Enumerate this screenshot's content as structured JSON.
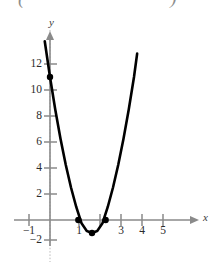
{
  "header": {
    "cropped_formula_fragment": "(              =              )"
  },
  "figure": {
    "x_axis_label": "x",
    "y_axis_label": "y"
  },
  "chart_data": {
    "type": "line",
    "title": "",
    "subtitle": "",
    "xlabel": "x",
    "ylabel": "y",
    "xlim": [
      -1.6,
      5.8
    ],
    "ylim": [
      -2.8,
      13.6
    ],
    "grid": false,
    "legend": null,
    "x_ticks": [
      -1,
      1,
      2,
      3,
      4,
      5
    ],
    "x_tick_labels": [
      "−1",
      "1",
      "",
      "3",
      "4",
      "5"
    ],
    "y_ticks": [
      -2,
      2,
      4,
      6,
      8,
      10,
      12
    ],
    "y_tick_labels": [
      "−2",
      "2",
      "4",
      "6",
      "8",
      "10",
      "12"
    ],
    "curve_name": "parabola",
    "curve_domain": [
      -0.25,
      4.15
    ],
    "series": [
      {
        "name": "parabola",
        "x": [
          -0.25,
          0.0,
          0.25,
          0.5,
          0.75,
          1.0,
          1.25,
          1.5,
          1.75,
          2.0,
          2.25,
          2.5,
          2.75,
          3.0,
          3.25,
          3.5,
          3.75,
          4.0,
          4.15
        ],
        "y": [
          13.75,
          11.0,
          8.5,
          6.25,
          4.25,
          2.5,
          1.0,
          -0.25,
          -0.85,
          -1.0,
          -0.85,
          -0.25,
          1.0,
          2.5,
          4.25,
          6.25,
          8.5,
          11.0,
          12.8
        ]
      }
    ],
    "marked_points": [
      {
        "label": "y-intercept",
        "x": 0,
        "y": 11
      },
      {
        "label": "x-intercept-left",
        "x": 1.35,
        "y": 0
      },
      {
        "label": "x-intercept-right",
        "x": 2.65,
        "y": 0
      },
      {
        "label": "vertex",
        "x": 2,
        "y": -1
      }
    ],
    "colors": {
      "curve": "#000000",
      "axis": "#8a8a8a",
      "point": "#000000",
      "tick_text": "#2b2b2b"
    }
  }
}
